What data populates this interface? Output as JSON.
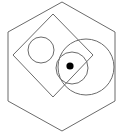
{
  "figure": {
    "background_color": "#ffffff",
    "stroke_color": "#6b6b6b",
    "fill_color": "#000000",
    "stroke_width": 1,
    "canvas": {
      "width": 121,
      "height": 133
    },
    "shapes": [
      {
        "name": "hexagon",
        "type": "polygon",
        "label": "Outer hexagon",
        "filled": false,
        "points": "62,2 115,32 115,101 62,131 8,101 8,32"
      },
      {
        "name": "diamond",
        "type": "polygon",
        "label": "Rotated square (diamond)",
        "filled": false,
        "points": "53,14 93,55 53,97 13,55"
      },
      {
        "name": "small-circle",
        "type": "circle",
        "label": "Small circle (upper left)",
        "filled": false,
        "cx": 41,
        "cy": 50,
        "r": 13
      },
      {
        "name": "large-circle",
        "type": "circle",
        "label": "Large circle (right)",
        "filled": false,
        "cx": 86,
        "cy": 67,
        "r": 28
      },
      {
        "name": "medium-circle",
        "type": "circle",
        "label": "Medium circle (center, contains dot)",
        "filled": false,
        "cx": 72,
        "cy": 68,
        "r": 16
      },
      {
        "name": "center-dot",
        "type": "circle",
        "label": "Filled center dot",
        "filled": true,
        "cx": 70,
        "cy": 66,
        "r": 3.6
      }
    ]
  }
}
